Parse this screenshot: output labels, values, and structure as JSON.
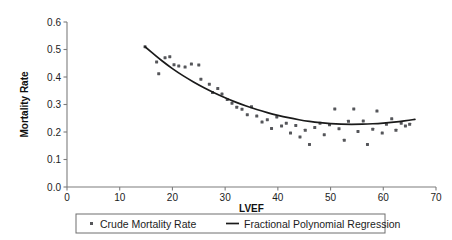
{
  "chart_data": {
    "type": "scatter",
    "title": "",
    "xlabel": "LVEF",
    "ylabel": "Mortality Rate",
    "xlim": [
      0,
      70
    ],
    "ylim": [
      0.0,
      0.6
    ],
    "grid": false,
    "legend_position": "bottom",
    "x_ticks": [
      0,
      10,
      20,
      30,
      40,
      50,
      60,
      70
    ],
    "x_tick_labels": [
      "0",
      "10",
      "20",
      "30",
      "40",
      "50",
      "60",
      "70"
    ],
    "y_ticks": [
      0.0,
      0.1,
      0.2,
      0.3,
      0.4,
      0.5,
      0.6
    ],
    "y_tick_labels": [
      "0.0",
      "0.1",
      "0.2",
      "0.3",
      "0.4",
      "0.5",
      "0.6"
    ],
    "legend": [
      {
        "label": "Crude Mortality Rate",
        "marker": "dot",
        "color": "#55565a"
      },
      {
        "label": "Fractional Polynomial Regression",
        "marker": "line",
        "color": "#1a1a1a"
      }
    ],
    "series": [
      {
        "name": "Crude Mortality Rate",
        "type": "scatter",
        "marker": "square-dot",
        "color": "#55565a",
        "points": [
          [
            14.8,
            0.51
          ],
          [
            17.0,
            0.455
          ],
          [
            17.4,
            0.412
          ],
          [
            18.6,
            0.47
          ],
          [
            19.5,
            0.474
          ],
          [
            20.3,
            0.445
          ],
          [
            21.2,
            0.44
          ],
          [
            22.4,
            0.436
          ],
          [
            23.6,
            0.447
          ],
          [
            25.0,
            0.444
          ],
          [
            25.4,
            0.392
          ],
          [
            27.0,
            0.374
          ],
          [
            27.6,
            0.344
          ],
          [
            28.6,
            0.358
          ],
          [
            29.4,
            0.338
          ],
          [
            30.4,
            0.318
          ],
          [
            31.3,
            0.305
          ],
          [
            32.2,
            0.29
          ],
          [
            33.2,
            0.283
          ],
          [
            34.2,
            0.263
          ],
          [
            35.0,
            0.292
          ],
          [
            36.0,
            0.258
          ],
          [
            37.0,
            0.236
          ],
          [
            38.0,
            0.245
          ],
          [
            38.8,
            0.213
          ],
          [
            39.8,
            0.255
          ],
          [
            40.7,
            0.222
          ],
          [
            41.6,
            0.232
          ],
          [
            42.4,
            0.196
          ],
          [
            43.4,
            0.224
          ],
          [
            44.2,
            0.182
          ],
          [
            45.2,
            0.206
          ],
          [
            46.0,
            0.155
          ],
          [
            47.0,
            0.216
          ],
          [
            48.0,
            0.232
          ],
          [
            48.8,
            0.19
          ],
          [
            49.8,
            0.226
          ],
          [
            50.8,
            0.284
          ],
          [
            51.6,
            0.212
          ],
          [
            52.6,
            0.17
          ],
          [
            53.4,
            0.239
          ],
          [
            54.4,
            0.284
          ],
          [
            55.2,
            0.202
          ],
          [
            56.2,
            0.24
          ],
          [
            57.0,
            0.155
          ],
          [
            58.0,
            0.21
          ],
          [
            58.8,
            0.276
          ],
          [
            59.8,
            0.196
          ],
          [
            60.6,
            0.228
          ],
          [
            61.6,
            0.248
          ],
          [
            62.4,
            0.206
          ],
          [
            63.4,
            0.232
          ],
          [
            64.2,
            0.222
          ],
          [
            65.0,
            0.228
          ]
        ]
      },
      {
        "name": "Fractional Polynomial Regression",
        "type": "line",
        "color": "#1a1a1a",
        "points": [
          [
            14.8,
            0.51
          ],
          [
            17.0,
            0.474
          ],
          [
            19.0,
            0.444
          ],
          [
            21.0,
            0.417
          ],
          [
            23.0,
            0.393
          ],
          [
            25.0,
            0.371
          ],
          [
            27.0,
            0.351
          ],
          [
            29.0,
            0.333
          ],
          [
            31.0,
            0.316
          ],
          [
            33.0,
            0.301
          ],
          [
            35.0,
            0.288
          ],
          [
            37.0,
            0.276
          ],
          [
            39.0,
            0.265
          ],
          [
            41.0,
            0.256
          ],
          [
            43.0,
            0.248
          ],
          [
            45.0,
            0.241
          ],
          [
            47.0,
            0.236
          ],
          [
            49.0,
            0.232
          ],
          [
            51.0,
            0.229
          ],
          [
            53.0,
            0.228
          ],
          [
            55.0,
            0.228
          ],
          [
            57.0,
            0.229
          ],
          [
            59.0,
            0.231
          ],
          [
            61.0,
            0.234
          ],
          [
            63.0,
            0.238
          ],
          [
            65.0,
            0.243
          ],
          [
            66.0,
            0.246
          ]
        ]
      }
    ]
  }
}
